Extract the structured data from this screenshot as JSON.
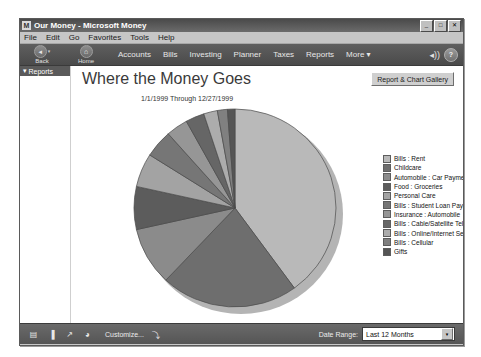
{
  "window": {
    "title": "Our Money - Microsoft Money",
    "app_icon": "M",
    "minimize_label": "_",
    "maximize_label": "□",
    "close_label": "✕"
  },
  "menubar": {
    "items": [
      "File",
      "Edit",
      "Go",
      "Favorites",
      "Tools",
      "Help"
    ]
  },
  "toolbar": {
    "back_label": "Back",
    "back_icon": "◂",
    "back_caret": "▾",
    "home_label": "Home",
    "home_icon": "⌂",
    "links": [
      "Accounts",
      "Bills",
      "Investing",
      "Planner",
      "Taxes",
      "Reports",
      "More ▾"
    ],
    "sound_icon": "◂))",
    "help_icon": "?"
  },
  "sidebar": {
    "header_label": "Reports",
    "header_caret": "▾"
  },
  "content": {
    "page_title": "Where the Money Goes",
    "gallery_button": "Report & Chart Gallery",
    "date_caption": "1/1/1999 Through 12/27/1999"
  },
  "bottombar": {
    "tools": [
      {
        "name": "report-grid-icon",
        "glyph": "▤"
      },
      {
        "name": "bar-chart-icon",
        "glyph": "▐"
      },
      {
        "name": "line-chart-icon",
        "glyph": "↗"
      },
      {
        "name": "pie-chart-icon",
        "glyph": "◕"
      }
    ],
    "customize_label": "Customize...",
    "export_icon": "⤵",
    "date_range_label": "Date Range:",
    "date_range_value": "Last 12 Months",
    "date_range_arrow": "▾"
  },
  "chart_data": {
    "type": "pie",
    "title": "Where the Money Goes",
    "subtitle": "1/1/1999 Through 12/27/1999",
    "legend_position": "right",
    "grid": false,
    "categories": [
      "Bills : Rent",
      "Childcare",
      "Automobile : Car Payment",
      "Food : Groceries",
      "Personal Care",
      "Bills : Student Loan Payment",
      "Insurance : Automobile",
      "Bills : Cable/Satellite Television",
      "Bills : Online/Internet Service",
      "Bills : Cellular",
      "Gifts"
    ],
    "values": [
      40.0,
      22.0,
      9.5,
      7.0,
      5.5,
      4.5,
      3.5,
      3.0,
      2.2,
      1.6,
      1.2
    ],
    "unit": "percent",
    "colors": [
      "#b9b9b9",
      "#6e6e6e",
      "#8b8b8b",
      "#5c5c5c",
      "#a3a3a3",
      "#767676",
      "#969696",
      "#666666",
      "#acacac",
      "#808080",
      "#555555"
    ]
  }
}
